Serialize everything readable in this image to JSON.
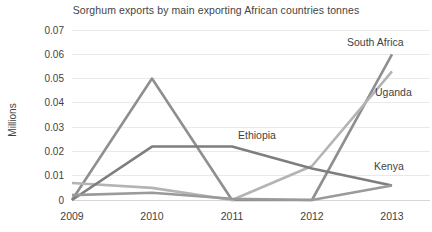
{
  "chart_data": {
    "type": "line",
    "title": "Sorghum exports by main exporting African countries tonnes",
    "xlabel": "",
    "ylabel": "Millions",
    "categories": [
      "2009",
      "2010",
      "2011",
      "2012",
      "2013"
    ],
    "x": [
      2009,
      2010,
      2011,
      2012,
      2013
    ],
    "ylim": [
      0,
      0.07
    ],
    "yticks": [
      "0",
      "0.01",
      "0.02",
      "0.03",
      "0.04",
      "0.05",
      "0.06",
      "0.07"
    ],
    "ytick_values": [
      0,
      0.01,
      0.02,
      0.03,
      0.04,
      0.05,
      0.06,
      0.07
    ],
    "grid": true,
    "legend_position": "inline-labels",
    "series": [
      {
        "name": "South Africa",
        "color": "#8f8f8f",
        "values": [
          0.0,
          0.05,
          0.0,
          0.0,
          0.06
        ],
        "label_x": 2013,
        "label_value": 0.066
      },
      {
        "name": "Uganda",
        "color": "#b4b4b4",
        "values": [
          0.007,
          0.005,
          0.0,
          0.014,
          0.053
        ],
        "label_x": 2013,
        "label_value": 0.044
      },
      {
        "name": "Ethiopia",
        "color": "#7e7e7e",
        "values": [
          0.0,
          0.022,
          0.022,
          0.013,
          0.006
        ],
        "label_x": 2011,
        "label_value": 0.027
      },
      {
        "name": "Kenya",
        "color": "#9a9a9a",
        "values": [
          0.002,
          0.003,
          0.0005,
          0.0,
          0.006
        ],
        "label_x": 2013,
        "label_value": 0.019
      }
    ],
    "annotations": [
      {
        "text": "South Africa",
        "series": "South Africa"
      },
      {
        "text": "Uganda",
        "series": "Uganda"
      },
      {
        "text": "Ethiopia",
        "series": "Ethiopia"
      },
      {
        "text": "Kenya",
        "series": "Kenya"
      }
    ]
  }
}
